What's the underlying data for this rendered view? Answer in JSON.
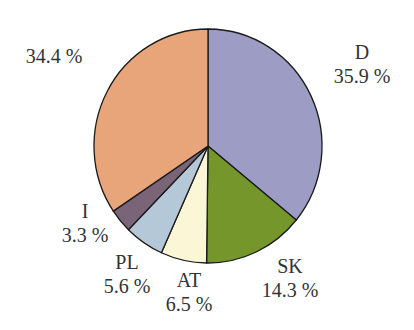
{
  "chart_data": {
    "type": "pie",
    "title": "",
    "start_angle_deg": 0,
    "direction": "clockwise",
    "slices": [
      {
        "name": "D",
        "value": 35.9,
        "label": "35.9 %",
        "color": "#9c9cc4"
      },
      {
        "name": "SK",
        "value": 14.3,
        "label": "14.3 %",
        "color": "#74962a"
      },
      {
        "name": "AT",
        "value": 6.5,
        "label": "6.5 %",
        "color": "#faf6d6"
      },
      {
        "name": "PL",
        "value": 5.6,
        "label": "5.6 %",
        "color": "#b4c8d8"
      },
      {
        "name": "I",
        "value": 3.3,
        "label": "3.3 %",
        "color": "#7a6478"
      },
      {
        "name": "",
        "value": 34.4,
        "label": "34.4 %",
        "color": "#e8a57a"
      }
    ],
    "legend": "none",
    "labels_outside": true
  },
  "labels": {
    "d_name": "D",
    "d_value": "35.9 %",
    "sk_name": "SK",
    "sk_value": "14.3 %",
    "at_name": "AT",
    "at_value": "6.5 %",
    "pl_name": "PL",
    "pl_value": "5.6 %",
    "i_name": "I",
    "i_value": "3.3 %",
    "other_value": "34.4 %"
  }
}
